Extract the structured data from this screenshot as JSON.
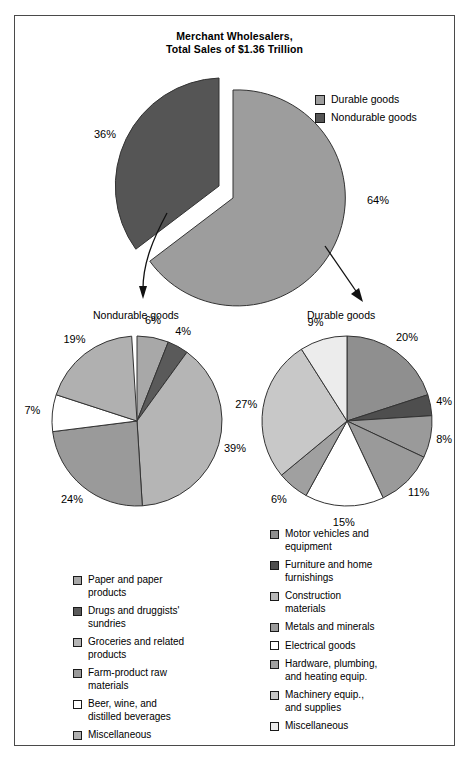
{
  "title": {
    "line1": "Merchant Wholesalers,",
    "line2": "Total Sales of $1.36 Trillion"
  },
  "top_legend": [
    {
      "label": "Durable goods",
      "color": "#9d9d9d"
    },
    {
      "label": "Nondurable goods",
      "color": "#555555"
    }
  ],
  "main_pie": {
    "labels": [
      "36%",
      "64%"
    ]
  },
  "annotations": {
    "nondurable": "Nondurable goods",
    "durable": "Durable goods"
  },
  "nondurable_legend": [
    {
      "label": "Paper and paper\nproducts",
      "color": "#a8a8a8"
    },
    {
      "label": "Drugs and druggists'\nsundries",
      "color": "#5a5a5a"
    },
    {
      "label": "Groceries and related\nproducts",
      "color": "#b5b5b5"
    },
    {
      "label": "Farm-product raw\nmaterials",
      "color": "#9a9a9a"
    },
    {
      "label": "Beer, wine, and\ndistilled beverages",
      "color": "#ffffff"
    },
    {
      "label": "Miscellaneous",
      "color": "#b0b0b0"
    }
  ],
  "durable_legend": [
    {
      "label": "Motor vehicles and\nequipment",
      "color": "#8f8f8f"
    },
    {
      "label": "Furniture and home\nfurnishings",
      "color": "#4e4e4e"
    },
    {
      "label": "Construction\nmaterials",
      "color": "#b8b8b8"
    },
    {
      "label": "Metals and minerals",
      "color": "#9a9a9a"
    },
    {
      "label": "Electrical goods",
      "color": "#ffffff"
    },
    {
      "label": "Hardware, plumbing,\nand heating equip.",
      "color": "#a0a0a0"
    },
    {
      "label": "Machinery equip.,\nand supplies",
      "color": "#c8c8c8"
    },
    {
      "label": "Miscellaneous",
      "color": "#ececec"
    }
  ],
  "chart_data": [
    {
      "type": "pie",
      "title": "Merchant Wholesalers, Total Sales of $1.36 Trillion",
      "categories": [
        "Durable goods",
        "Nondurable goods"
      ],
      "values": [
        64,
        36
      ],
      "unit": "percent",
      "colors": [
        "#9d9d9d",
        "#555555"
      ],
      "exploded": [
        "Nondurable goods"
      ],
      "legend_position": "top-right",
      "total_sales": "$1.36 Trillion"
    },
    {
      "type": "pie",
      "title": "Nondurable goods",
      "categories": [
        "Paper and paper products",
        "Drugs and druggists' sundries",
        "Groceries and related products",
        "Farm-product raw materials",
        "Beer, wine, and distilled beverages",
        "Miscellaneous"
      ],
      "values": [
        6,
        4,
        39,
        24,
        7,
        19
      ],
      "unit": "percent",
      "colors": [
        "#a8a8a8",
        "#5a5a5a",
        "#b5b5b5",
        "#9a9a9a",
        "#ffffff",
        "#b0b0b0"
      ],
      "legend_position": "below",
      "start_angle_deg": 0,
      "direction": "clockwise"
    },
    {
      "type": "pie",
      "title": "Durable goods",
      "categories": [
        "Motor vehicles and equipment",
        "Furniture and home furnishings",
        "Construction materials",
        "Metals and minerals",
        "Electrical goods",
        "Hardware, plumbing, and heating equip.",
        "Machinery equip., and supplies",
        "Miscellaneous"
      ],
      "values": [
        20,
        4,
        8,
        11,
        15,
        6,
        27,
        9
      ],
      "unit": "percent",
      "colors": [
        "#8f8f8f",
        "#4e4e4e",
        "#9a9a9a",
        "#9a9a9a",
        "#ffffff",
        "#a0a0a0",
        "#c8c8c8",
        "#ececec"
      ],
      "legend_position": "below",
      "start_angle_deg": 0,
      "direction": "clockwise"
    }
  ]
}
